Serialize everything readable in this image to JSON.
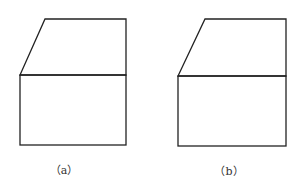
{
  "figures": [
    {
      "id": "a",
      "caption": "（a）",
      "caption_pos": [
        64,
        169
      ],
      "shape": {
        "top_left": [
          45,
          19
        ],
        "top_right": [
          126,
          19
        ],
        "mid_left": [
          20,
          75
        ],
        "mid_right": [
          126,
          75
        ],
        "bottom_left": [
          20,
          145
        ],
        "bottom_right": [
          126,
          145
        ]
      }
    },
    {
      "id": "b",
      "caption": "（b）",
      "caption_pos": [
        229,
        170
      ],
      "shape": {
        "top_left": [
          205,
          19
        ],
        "top_right": [
          286,
          19
        ],
        "mid_left": [
          178,
          76
        ],
        "mid_right": [
          286,
          76
        ],
        "bottom_left": [
          178,
          146
        ],
        "bottom_right": [
          286,
          146
        ]
      }
    }
  ],
  "colors": {
    "stroke": "#222222",
    "background": "#ffffff"
  }
}
